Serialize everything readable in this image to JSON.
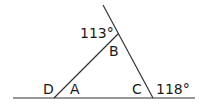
{
  "diagram": {
    "type": "triangle-exterior-angles",
    "stroke_color": "#333333",
    "background": "#ffffff",
    "lines": {
      "base": {
        "x1": 13,
        "y1": 98,
        "x2": 195,
        "y2": 98
      },
      "side_AB": {
        "x1": 54,
        "y1": 98,
        "x2": 118,
        "y2": 34
      },
      "side_CB_extended": {
        "x1": 153,
        "y1": 98,
        "x2": 103,
        "y2": 5
      }
    },
    "vertices": {
      "A": {
        "x": 54,
        "y": 98
      },
      "B": {
        "x": 118,
        "y": 34
      },
      "C": {
        "x": 153,
        "y": 98
      }
    },
    "labels": {
      "angle_top": "113°",
      "B": "B",
      "D": "D",
      "A": "A",
      "C": "C",
      "angle_right": "118°"
    }
  }
}
